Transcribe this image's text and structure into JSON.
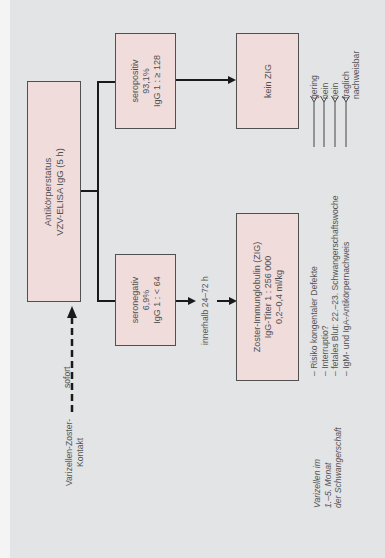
{
  "diagram": {
    "orientation": "rotated-90-ccw",
    "colors": {
      "background": "#e3e4e6",
      "box_fill": "#f1dcdc",
      "box_border": "#505050",
      "line": "#1a1a1a"
    },
    "start": {
      "label_lines": [
        "Varizellen-Zoster-",
        "Kontakt"
      ],
      "arrow_label": "sofort"
    },
    "test_box": {
      "lines": [
        "Antikörperstatus",
        "VZV-ELISA IgG (5 h)"
      ]
    },
    "seropositive": {
      "lines": [
        "seropositiv",
        "93,1%",
        "IgG 1 : ≥ 128"
      ]
    },
    "seronegative": {
      "lines": [
        "seronegativ",
        "6,9%",
        "IgG 1 : < 64"
      ]
    },
    "no_zig": {
      "lines": [
        "kein ZIG"
      ]
    },
    "timing_label": "innerhalb 24–72 h",
    "zig_box": {
      "lines": [
        "Zoster-Immunglobulin (ZIG)",
        "IgG-Titer 1 : 256 000",
        "0,2–0,4 ml/kg"
      ]
    },
    "risks": {
      "items": [
        "– Risiko kongentaler Defekte",
        "– Interruptio?",
        "– fetales Blut: 22.–23. Schwangerschaftswoche",
        "– IgM- und IgA-Antikörpernachweis"
      ],
      "answers": [
        "gering",
        "nein",
        "nein",
        "fraglich",
        "nachweisbar"
      ]
    },
    "context": {
      "lines": [
        "Varizellen im",
        "1.–5. Monat",
        "der Schwangerschaft"
      ]
    }
  }
}
